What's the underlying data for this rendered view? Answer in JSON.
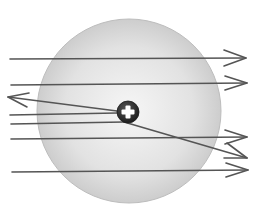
{
  "diagram": {
    "title": "Alpha particle scattering by an atom (Rutherford model)",
    "atom": {
      "label": "atom",
      "fill_center": "#f4f4f4",
      "fill_edge": "#cfcfcf",
      "stroke": "#b8b8b8"
    },
    "nucleus": {
      "label": "nucleus",
      "symbol": "+",
      "fill": "#2e2e2e",
      "symbol_color": "#ffffff"
    },
    "particle_paths": [
      {
        "id": "path-1",
        "behavior": "passes straight through"
      },
      {
        "id": "path-2",
        "behavior": "passes straight through"
      },
      {
        "id": "path-3",
        "behavior": "reflected back from nucleus"
      },
      {
        "id": "path-4",
        "behavior": "deflected downward by nucleus"
      },
      {
        "id": "path-5",
        "behavior": "passes straight through"
      },
      {
        "id": "path-6",
        "behavior": "passes straight through"
      }
    ],
    "line_color": "#555555"
  }
}
